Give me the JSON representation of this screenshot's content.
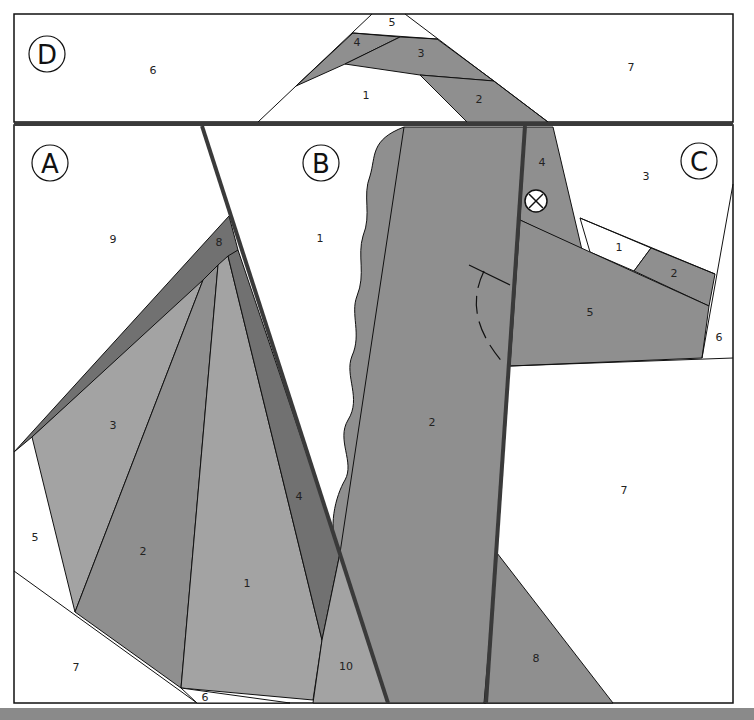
{
  "colors": {
    "white": "#ffffff",
    "light_gray": "#a3a3a3",
    "medium_gray": "#8f8f8f",
    "dark_gray": "#717171",
    "outline": "#111111",
    "seam": "#3a3a3a"
  },
  "sections": {
    "A": {
      "label": "A",
      "pieces": {
        "p1": "1",
        "p2": "2",
        "p3": "3",
        "p4": "4",
        "p5": "5",
        "p6": "6",
        "p7": "7",
        "p8": "8",
        "p9": "9",
        "p10": "10"
      }
    },
    "B": {
      "label": "B",
      "pieces": {
        "p1": "1",
        "p2": "2"
      }
    },
    "C": {
      "label": "C",
      "pieces": {
        "p1": "1",
        "p2": "2",
        "p3": "3",
        "p4": "4",
        "p5": "5",
        "p6": "6",
        "p7": "7",
        "p8": "8"
      }
    },
    "D": {
      "label": "D",
      "pieces": {
        "p1": "1",
        "p2": "2",
        "p3": "3",
        "p4": "4",
        "p5": "5",
        "p6": "6",
        "p7": "7"
      }
    }
  },
  "markers": {
    "alignment_mark": "crossed-circle-icon"
  }
}
